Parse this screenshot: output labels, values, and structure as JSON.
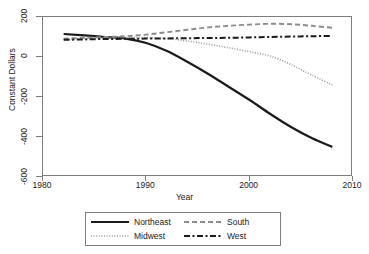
{
  "chart_data": {
    "type": "line",
    "title": "",
    "xlabel": "Year",
    "ylabel": "Constant Dollars",
    "xlim": [
      1980,
      2010
    ],
    "ylim": [
      -600,
      200
    ],
    "xticks": [
      1980,
      1990,
      2000,
      2010
    ],
    "yticks": [
      200,
      0,
      -200,
      -400,
      -600
    ],
    "xtick_labels": [
      "1980",
      "1990",
      "2000",
      "2010"
    ],
    "ytick_labels": [
      "200",
      "0",
      "-200",
      "-400",
      "-600"
    ],
    "grid": false,
    "legend_position": "below-center",
    "x": [
      1982,
      1984,
      1986,
      1988,
      1990,
      1992,
      1994,
      1996,
      1998,
      2000,
      2002,
      2004,
      2006,
      2008
    ],
    "series": [
      {
        "name": "Northeast",
        "style": "solid",
        "color": "#1a1a1a",
        "width": 2.2,
        "values": [
          115,
          108,
          100,
          92,
          70,
          30,
          -25,
          -85,
          -150,
          -215,
          -285,
          -350,
          -405,
          -450
        ]
      },
      {
        "name": "Midwest",
        "style": "dotted",
        "color": "#9a9a9a",
        "width": 1.6,
        "values": [
          88,
          92,
          95,
          97,
          97,
          92,
          80,
          64,
          46,
          26,
          5,
          -38,
          -90,
          -140
        ]
      },
      {
        "name": "South",
        "style": "dashed",
        "color": "#8c8c8c",
        "width": 1.9,
        "values": [
          92,
          96,
          100,
          104,
          112,
          124,
          136,
          148,
          156,
          162,
          166,
          164,
          156,
          146
        ]
      },
      {
        "name": "West",
        "style": "dashdot",
        "color": "#1a1a1a",
        "width": 2.0,
        "values": [
          86,
          88,
          90,
          91,
          92,
          93,
          94,
          95,
          96,
          98,
          100,
          102,
          104,
          105
        ]
      }
    ]
  },
  "axis": {
    "y_title": "Constant Dollars",
    "x_title": "Year"
  },
  "legend": {
    "items": [
      {
        "label": "Northeast"
      },
      {
        "label": "South"
      },
      {
        "label": "Midwest"
      },
      {
        "label": "West"
      }
    ]
  }
}
